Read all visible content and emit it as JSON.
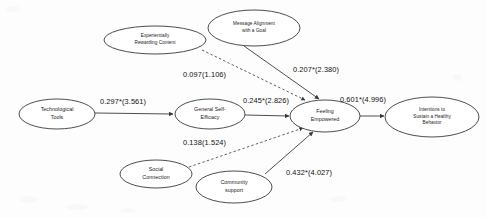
{
  "diagram": {
    "type": "path-diagram",
    "background_color": "#fdfdfd",
    "line_color": "#3a3a3a",
    "text_color": "#1a1a1a",
    "nodes": [
      {
        "id": "technological-tools",
        "label": "Technological\nTools",
        "cx": 57,
        "cy": 114,
        "rx": 38,
        "ry": 15
      },
      {
        "id": "experientially-rewarding-content",
        "label": "Experientially\nRewarding Content",
        "cx": 155,
        "cy": 40,
        "rx": 51,
        "ry": 14
      },
      {
        "id": "message-alignment-with-a-goal",
        "label": "Message Alignment\nwith a Goal",
        "cx": 254,
        "cy": 28,
        "rx": 46,
        "ry": 18
      },
      {
        "id": "general-self-efficacy",
        "label": "General Self-\nEfficacy",
        "cx": 210,
        "cy": 114,
        "rx": 35,
        "ry": 15
      },
      {
        "id": "feeling-empowered",
        "label": "Feeling\nEmpowered",
        "cx": 325,
        "cy": 116,
        "rx": 35,
        "ry": 16
      },
      {
        "id": "intentions-to-sustain-a-healthy-behavior",
        "label": "Intentions to\nSustain a Healthy\nBehavior",
        "cx": 432,
        "cy": 117,
        "rx": 47,
        "ry": 20
      },
      {
        "id": "social-connection",
        "label": "Social\nConnection",
        "cx": 156,
        "cy": 174,
        "rx": 36,
        "ry": 14
      },
      {
        "id": "community-support",
        "label": "Community\nsupport",
        "cx": 234,
        "cy": 187,
        "rx": 38,
        "ry": 16
      }
    ],
    "paths": [
      {
        "id": "tools-to-efficacy",
        "from": "technological-tools",
        "to": "general-self-efficacy",
        "coefficient": "0.297*(3.561)",
        "style": "solid",
        "label_x": 100,
        "label_y": 97,
        "x1": 95,
        "y1": 113,
        "x2": 173,
        "y2": 114
      },
      {
        "id": "efficacy-to-empowered",
        "from": "general-self-efficacy",
        "to": "feeling-empowered",
        "coefficient": "0.245*(2.826)",
        "style": "solid",
        "label_x": 243,
        "label_y": 96,
        "x1": 245,
        "y1": 115,
        "x2": 289,
        "y2": 116
      },
      {
        "id": "empowered-to-intentions",
        "from": "feeling-empowered",
        "to": "intentions-to-sustain-a-healthy-behavior",
        "coefficient": "0.601*(4.996)",
        "style": "solid",
        "label_x": 340,
        "label_y": 95,
        "x1": 360,
        "y1": 116,
        "x2": 384,
        "y2": 116
      },
      {
        "id": "message-to-empowered",
        "from": "message-alignment-with-a-goal",
        "to": "feeling-empowered",
        "coefficient": "0.207*(2.380)",
        "style": "solid",
        "label_x": 293,
        "label_y": 65,
        "x1": 244,
        "y1": 46,
        "x2": 319,
        "y2": 99
      },
      {
        "id": "content-to-empowered",
        "from": "experientially-rewarding-content",
        "to": "feeling-empowered",
        "coefficient": "0.097(1.106)",
        "style": "dashed",
        "label_x": 183,
        "label_y": 70,
        "x1": 202,
        "y1": 50,
        "x2": 305,
        "y2": 100
      },
      {
        "id": "social-to-empowered",
        "from": "social-connection",
        "to": "feeling-empowered",
        "coefficient": "0.138(1.524)",
        "style": "dashed",
        "label_x": 183,
        "label_y": 138,
        "x1": 189,
        "y1": 167,
        "x2": 303,
        "y2": 128
      },
      {
        "id": "community-to-empowered",
        "from": "community-support",
        "to": "feeling-empowered",
        "coefficient": "0.432*(4.027)",
        "style": "solid",
        "label_x": 286,
        "label_y": 168,
        "x1": 265,
        "y1": 174,
        "x2": 313,
        "y2": 132
      }
    ]
  }
}
